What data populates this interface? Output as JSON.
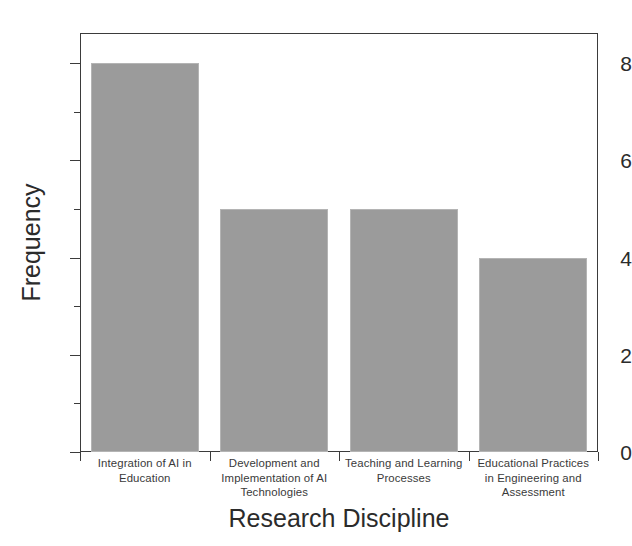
{
  "chart_data": {
    "type": "bar",
    "title": "",
    "xlabel": "Research Discipline",
    "ylabel": "Frequency",
    "categories": [
      "Integration of AI in Education",
      "Development and Implementation of AI Technologies",
      "Teaching and Learning Processes",
      "Educational Practices in Engineering and Assessment"
    ],
    "category_lines": [
      [
        "Integration of AI in",
        "Education"
      ],
      [
        "Development and",
        "Implementation of AI",
        "Technologies"
      ],
      [
        "Teaching and Learning",
        "Processes"
      ],
      [
        "Educational Practices",
        "in Engineering and",
        "Assessment"
      ]
    ],
    "values": [
      8,
      5,
      5,
      4
    ],
    "ylim": [
      0,
      8.62
    ],
    "ytick_labels": [
      "0",
      "2",
      "4",
      "6",
      "8"
    ],
    "ytick_values": [
      0,
      2,
      4,
      6,
      8
    ],
    "yminor_values": [
      1,
      3,
      5,
      7
    ],
    "grid": false,
    "legend": false,
    "bar_color": "#9b9b9b",
    "bar_edge_color": "#b4b4b4",
    "axis_color": "#3b3b3b",
    "background_color": "#ffffff"
  },
  "axis": {
    "y_title": "Frequency",
    "x_title": "Research Discipline"
  }
}
